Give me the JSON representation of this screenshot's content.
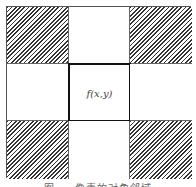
{
  "diagram": {
    "type": "3x3-pixel-neighborhood",
    "highlighted": "diagonal-neighbors",
    "center_label": "f(x,y)",
    "cells": [
      {
        "row": 1,
        "col": 1,
        "hatched": true
      },
      {
        "row": 1,
        "col": 2,
        "hatched": false
      },
      {
        "row": 1,
        "col": 3,
        "hatched": true
      },
      {
        "row": 2,
        "col": 1,
        "hatched": false
      },
      {
        "row": 2,
        "col": 2,
        "hatched": false,
        "center": true
      },
      {
        "row": 2,
        "col": 3,
        "hatched": false
      },
      {
        "row": 3,
        "col": 1,
        "hatched": true
      },
      {
        "row": 3,
        "col": 2,
        "hatched": false
      },
      {
        "row": 3,
        "col": 3,
        "hatched": true
      }
    ],
    "caption": "图 ...  像素的对角邻域"
  }
}
